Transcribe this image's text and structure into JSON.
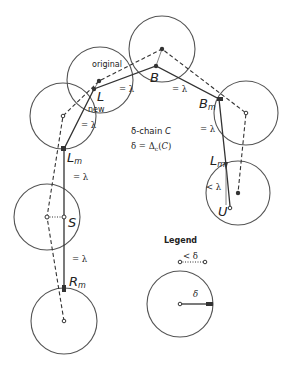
{
  "diagram": {
    "title_lines": [
      "δ-chain C",
      "δ = Δc(C)"
    ],
    "labels": {
      "original": "original",
      "new": "new",
      "L": "L",
      "B": "B",
      "Bm": "Bm",
      "Lm_left": "Lm",
      "Lm_right": "Lm",
      "S": "S",
      "Rm": "Rm",
      "U": "U"
    },
    "edge_labels": {
      "eq_lambda": "= λ",
      "lt_lambda": "< λ"
    },
    "legend": {
      "title": "Legend",
      "dotted_label": "< δ",
      "radius_label": "δ"
    },
    "circles": [
      {
        "name": "top",
        "cx": 162,
        "cy": 49,
        "r": 33
      },
      {
        "name": "original",
        "cx": 100,
        "cy": 80,
        "r": 33
      },
      {
        "name": "left-new",
        "cx": 63,
        "cy": 116,
        "r": 33
      },
      {
        "name": "s",
        "cx": 47,
        "cy": 217,
        "r": 33
      },
      {
        "name": "rm",
        "cx": 64,
        "cy": 321,
        "r": 33
      },
      {
        "name": "bm",
        "cx": 246,
        "cy": 113,
        "r": 32
      },
      {
        "name": "u",
        "cx": 238,
        "cy": 193,
        "r": 32
      },
      {
        "name": "legend",
        "cx": 180,
        "cy": 304,
        "r": 33
      }
    ]
  }
}
